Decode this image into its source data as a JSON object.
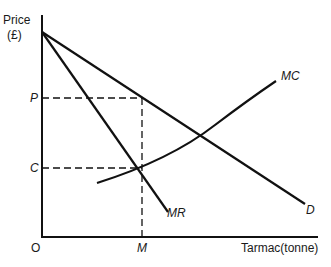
{
  "diagram": {
    "y_axis_label_line1": "Price",
    "y_axis_label_line2": "(£)",
    "x_axis_label": "Tarmac(tonne)",
    "origin_label": "O",
    "price_label": "P",
    "cost_label": "C",
    "quantity_label": "M",
    "curves": {
      "demand": "D",
      "marginal_revenue": "MR",
      "marginal_cost": "MC"
    },
    "colors": {
      "line": "#111111",
      "background": "#ffffff"
    }
  }
}
